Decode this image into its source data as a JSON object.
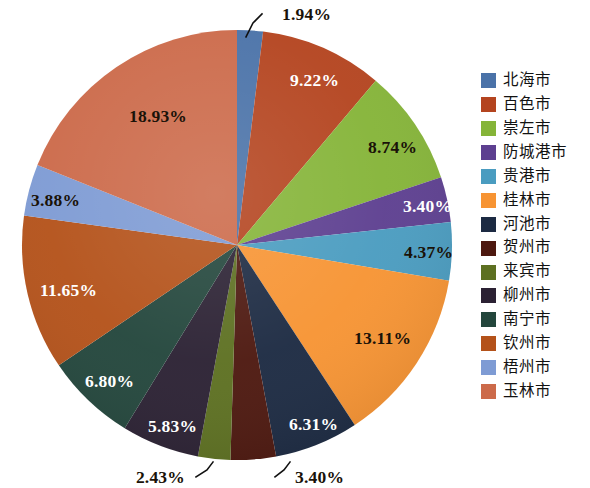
{
  "chart_data": {
    "type": "pie",
    "title": "",
    "value_unit": "%",
    "legend_position": "right",
    "start_angle_deg": 0,
    "direction": "clockwise",
    "center": {
      "x": 237,
      "y": 245
    },
    "radius": 215,
    "categories": [
      "北海市",
      "百色市",
      "崇左市",
      "防城港市",
      "贵港市",
      "桂林市",
      "河池市",
      "贺州市",
      "来宾市",
      "柳州市",
      "南宁市",
      "钦州市",
      "梧州市",
      "玉林市"
    ],
    "labels": [
      "1.94%",
      "9.22%",
      "8.74%",
      "3.40%",
      "4.37%",
      "13.11%",
      "6.31%",
      "3.40%",
      "2.43%",
      "5.83%",
      "6.80%",
      "11.65%",
      "3.88%",
      "18.93%"
    ],
    "values": [
      1.94,
      9.22,
      8.74,
      3.4,
      4.37,
      13.11,
      6.31,
      3.4,
      2.43,
      5.83,
      6.8,
      11.65,
      3.88,
      18.93
    ],
    "colors": [
      "#4a72a8",
      "#b4441f",
      "#85b438",
      "#5d3f90",
      "#4a9cc0",
      "#f79433",
      "#1c2a42",
      "#4d180f",
      "#5d7021",
      "#2b2133",
      "#23463c",
      "#b4521a",
      "#7e9bd4",
      "#cc6a4a"
    ],
    "label_text_colors": [
      "dark",
      "light",
      "dark",
      "light",
      "dark",
      "dark",
      "light",
      "dark",
      "dark",
      "light",
      "light",
      "light",
      "dark",
      "dark"
    ],
    "slices": [
      {
        "name": "北海市",
        "value": 1.94,
        "label": "1.94%",
        "color": "#4a72a8",
        "leader": true
      },
      {
        "name": "百色市",
        "value": 9.22,
        "label": "9.22%",
        "color": "#b4441f",
        "leader": false
      },
      {
        "name": "崇左市",
        "value": 8.74,
        "label": "8.74%",
        "color": "#85b438",
        "leader": false
      },
      {
        "name": "防城港市",
        "value": 3.4,
        "label": "3.40%",
        "color": "#5d3f90",
        "leader": false
      },
      {
        "name": "贵港市",
        "value": 4.37,
        "label": "4.37%",
        "color": "#4a9cc0",
        "leader": false
      },
      {
        "name": "桂林市",
        "value": 13.11,
        "label": "13.11%",
        "color": "#f79433",
        "leader": false
      },
      {
        "name": "河池市",
        "value": 6.31,
        "label": "6.31%",
        "color": "#1c2a42",
        "leader": false
      },
      {
        "name": "贺州市",
        "value": 3.4,
        "label": "3.40%",
        "color": "#4d180f",
        "leader": true
      },
      {
        "name": "来宾市",
        "value": 2.43,
        "label": "2.43%",
        "color": "#5d7021",
        "leader": true
      },
      {
        "name": "柳州市",
        "value": 5.83,
        "label": "5.83%",
        "color": "#2b2133",
        "leader": false
      },
      {
        "name": "南宁市",
        "value": 6.8,
        "label": "6.80%",
        "color": "#23463c",
        "leader": false
      },
      {
        "name": "钦州市",
        "value": 11.65,
        "label": "11.65%",
        "color": "#b4521a",
        "leader": false
      },
      {
        "name": "梧州市",
        "value": 3.88,
        "label": "3.88%",
        "color": "#7e9bd4",
        "leader": false
      },
      {
        "name": "玉林市",
        "value": 18.93,
        "label": "18.93%",
        "color": "#cc6a4a",
        "leader": false
      }
    ]
  },
  "legend": {
    "items": [
      {
        "label": "北海市",
        "color": "#4a72a8"
      },
      {
        "label": "百色市",
        "color": "#b4441f"
      },
      {
        "label": "崇左市",
        "color": "#85b438"
      },
      {
        "label": "防城港市",
        "color": "#5d3f90"
      },
      {
        "label": "贵港市",
        "color": "#4a9cc0"
      },
      {
        "label": "桂林市",
        "color": "#f79433"
      },
      {
        "label": "河池市",
        "color": "#1c2a42"
      },
      {
        "label": "贺州市",
        "color": "#4d180f"
      },
      {
        "label": "来宾市",
        "color": "#5d7021"
      },
      {
        "label": "柳州市",
        "color": "#2b2133"
      },
      {
        "label": "南宁市",
        "color": "#23463c"
      },
      {
        "label": "钦州市",
        "color": "#b4521a"
      },
      {
        "label": "梧州市",
        "color": "#7e9bd4"
      },
      {
        "label": "玉林市",
        "color": "#cc6a4a"
      }
    ]
  },
  "callouts": [
    {
      "label": "1.94%",
      "x": 282,
      "y": 20,
      "anchor": "start",
      "tone": "dark",
      "line": [
        [
          262,
          14
        ],
        [
          253,
          23
        ],
        [
          246,
          37
        ]
      ]
    },
    {
      "label": "3.40%",
      "x": 295,
      "y": 483,
      "anchor": "start",
      "tone": "dark",
      "line": [
        [
          275,
          477
        ],
        [
          284,
          470
        ],
        [
          290,
          462
        ]
      ]
    },
    {
      "label": "2.43%",
      "x": 185,
      "y": 483,
      "anchor": "end",
      "tone": "dark",
      "line": [
        [
          196,
          477
        ],
        [
          207,
          470
        ],
        [
          213,
          462
        ]
      ]
    }
  ],
  "inline_labels": [
    {
      "label": "18.93%",
      "x": 129,
      "y": 122,
      "tone": "dark"
    },
    {
      "label": "9.22%",
      "x": 290,
      "y": 86,
      "tone": "light"
    },
    {
      "label": "8.74%",
      "x": 368,
      "y": 153,
      "tone": "dark"
    },
    {
      "label": "3.40%",
      "x": 403,
      "y": 212,
      "tone": "light"
    },
    {
      "label": "4.37%",
      "x": 404,
      "y": 258,
      "tone": "dark"
    },
    {
      "label": "13.11%",
      "x": 354,
      "y": 344,
      "tone": "dark"
    },
    {
      "label": "6.31%",
      "x": 289,
      "y": 430,
      "tone": "light"
    },
    {
      "label": "5.83%",
      "x": 148,
      "y": 432,
      "tone": "light"
    },
    {
      "label": "6.80%",
      "x": 85,
      "y": 387,
      "tone": "light"
    },
    {
      "label": "11.65%",
      "x": 40,
      "y": 296,
      "tone": "light"
    },
    {
      "label": "3.88%",
      "x": 31,
      "y": 206,
      "tone": "dark"
    }
  ]
}
